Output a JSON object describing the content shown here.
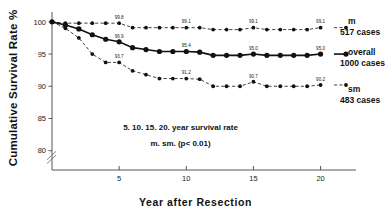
{
  "chart_data": {
    "type": "line",
    "title": "",
    "xlabel": "Year  after  Resection",
    "ylabel": "Cumulative Survival Rate %",
    "xlim": [
      0,
      21
    ],
    "ylim": [
      77,
      100.6
    ],
    "xticks": [
      "5",
      "10",
      "15",
      "20"
    ],
    "xtick_values": [
      5,
      10,
      15,
      20
    ],
    "yticks": [
      "100",
      "95",
      "90",
      "85",
      "80"
    ],
    "ytick_values": [
      100,
      95,
      90,
      85,
      80
    ],
    "grid": false,
    "axis_break": true,
    "legend_position": "right-of-plot",
    "annotation_line1": "5. 10. 15. 20. year survival rate",
    "annotation_line2": "m. sm. (p< 0.01)",
    "x": [
      0,
      1,
      2,
      3,
      4,
      5,
      6,
      7,
      8,
      9,
      10,
      11,
      12,
      13,
      14,
      15,
      16,
      17,
      18,
      19,
      20
    ],
    "series": [
      {
        "name": "m",
        "cases_label": "517 cases",
        "style": "dash-dot",
        "values": [
          100,
          99.8,
          99.8,
          99.8,
          99.8,
          99.8,
          99.1,
          99.1,
          99.1,
          99.1,
          99.1,
          99.1,
          98.8,
          98.8,
          98.8,
          99.1,
          98.8,
          98.8,
          98.8,
          98.8,
          99.1
        ],
        "point_labels": [
          {
            "x": 5,
            "text": "99.8"
          },
          {
            "x": 10,
            "text": "99.1"
          },
          {
            "x": 15,
            "text": "99.1"
          },
          {
            "x": 20,
            "text": "99.1"
          }
        ]
      },
      {
        "name": "overall",
        "cases_label": "1000 cases",
        "style": "solid",
        "values": [
          100,
          99.5,
          98.9,
          98.0,
          97.3,
          96.9,
          96.0,
          95.7,
          95.4,
          95.4,
          95.4,
          95.3,
          94.8,
          94.8,
          94.8,
          95.0,
          94.8,
          94.8,
          94.8,
          94.8,
          95.0
        ],
        "point_labels": [
          {
            "x": 5,
            "text": "96.9"
          },
          {
            "x": 10,
            "text": "95.4"
          },
          {
            "x": 15,
            "text": "95.0"
          },
          {
            "x": 20,
            "text": "95.0"
          }
        ]
      },
      {
        "name": "sm",
        "cases_label": "483 cases",
        "style": "dash-dot",
        "values": [
          100,
          99.0,
          97.5,
          95.0,
          93.7,
          93.7,
          92.4,
          91.8,
          91.2,
          91.2,
          91.2,
          91.1,
          90.0,
          90.0,
          90.0,
          90.7,
          90.0,
          90.0,
          90.0,
          90.0,
          90.2
        ],
        "point_labels": [
          {
            "x": 5,
            "text": "93.7"
          },
          {
            "x": 10,
            "text": "91.2"
          },
          {
            "x": 15,
            "text": "90.7"
          },
          {
            "x": 20,
            "text": "90.2"
          }
        ]
      }
    ]
  },
  "legend": {
    "m": {
      "name": "m",
      "cases": "517 cases"
    },
    "overall": {
      "name": "overall",
      "cases": "1000 cases"
    },
    "sm": {
      "name": "sm",
      "cases": "483 cases"
    }
  },
  "axis": {
    "ylabel": "Cumulative Survival Rate %",
    "xlabel": "Year  after  Resection"
  },
  "annotation": {
    "line1": "5. 10. 15. 20. year survival rate",
    "line2": "m. sm. (p< 0.01)"
  },
  "colors": {
    "ink": "#111111",
    "axis": "#555555",
    "background": "#ffffff"
  }
}
